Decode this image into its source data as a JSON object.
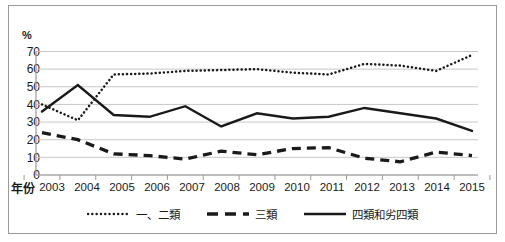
{
  "chart_data": {
    "type": "line",
    "title": "",
    "subtitle": "",
    "xlabel": "年份",
    "ylabel": "%",
    "ylim": [
      0,
      70
    ],
    "yticks": [
      0,
      10,
      20,
      30,
      40,
      50,
      60,
      70
    ],
    "grid": true,
    "legend_position": "bottom",
    "x": [
      "2003",
      "2004",
      "2005",
      "2006",
      "2007",
      "2008",
      "2009",
      "2010",
      "2011",
      "2012",
      "2013",
      "2014",
      "2015"
    ],
    "categories": [
      "2003",
      "2004",
      "2005",
      "2006",
      "2007",
      "2008",
      "2009",
      "2010",
      "2011",
      "2012",
      "2013",
      "2014",
      "2015"
    ],
    "series": [
      {
        "name": "一、二類",
        "style": "dotted",
        "color": "#1a1a1a",
        "values": [
          40,
          31,
          57,
          57.5,
          59,
          59.5,
          60,
          58,
          57,
          63,
          62,
          59,
          68
        ]
      },
      {
        "name": "三類",
        "style": "dashed",
        "color": "#1a1a1a",
        "values": [
          24,
          20,
          12,
          11,
          9,
          13.5,
          11.5,
          15,
          15.5,
          9.5,
          7.5,
          13,
          11
        ]
      },
      {
        "name": "四類和劣四類",
        "style": "solid",
        "color": "#1a1a1a",
        "values": [
          36,
          51,
          34,
          33,
          39,
          27.5,
          35,
          32,
          33,
          38,
          35,
          32,
          25
        ]
      }
    ]
  },
  "axes": {
    "unit_label": "%",
    "x_title": "年份",
    "y_ticks": [
      "70",
      "60",
      "50",
      "40",
      "30",
      "20",
      "10",
      "0"
    ],
    "x_ticks": [
      "2003",
      "2004",
      "2005",
      "2006",
      "2007",
      "2008",
      "2009",
      "2010",
      "2011",
      "2012",
      "2013",
      "2014",
      "2015"
    ]
  },
  "legend": {
    "items": [
      {
        "label": "一、二類",
        "style": "dotted"
      },
      {
        "label": "三類",
        "style": "dashed"
      },
      {
        "label": "四類和劣四類",
        "style": "solid"
      }
    ]
  },
  "colors": {
    "ink": "#1a1a1a",
    "grid": "#c8c8c8",
    "axis": "#9a9a9a",
    "frame": "#9a9a9a",
    "background": "#ffffff"
  }
}
